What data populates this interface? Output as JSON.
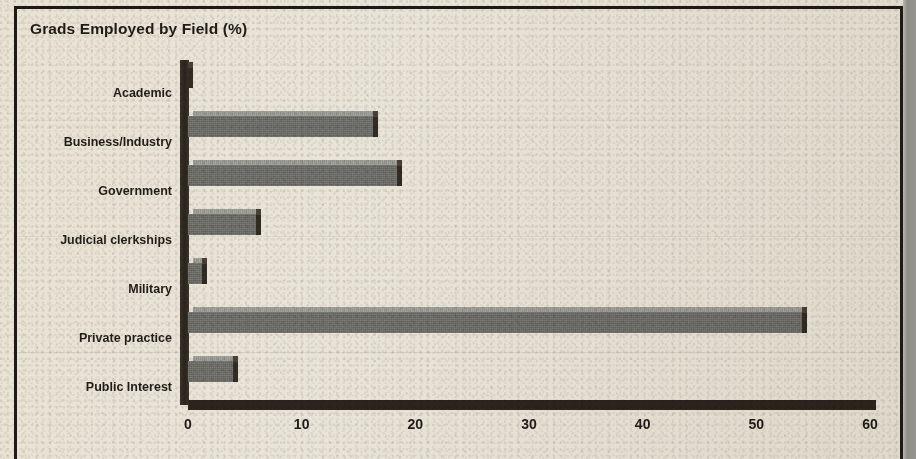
{
  "document": {
    "kind": "scanned-print-figure",
    "background_color": "#e9e4d9",
    "ink_color": "#201d19",
    "gutter_color": "#8f8d86"
  },
  "chart_data": {
    "type": "bar",
    "orientation": "horizontal",
    "title": "Grads Employed by Field (%)",
    "xlabel": "",
    "ylabel": "",
    "xlim": [
      0,
      60
    ],
    "grid": false,
    "legend": null,
    "style": "3d-shaded-bars",
    "bar_top_color": "#9d9d97",
    "bar_face_color": "#6d6d69",
    "bar_side_color": "#332c24",
    "axis_color": "#2b251e",
    "xticks": [
      0,
      10,
      20,
      30,
      40,
      50,
      60
    ],
    "xtick_labels": [
      "0",
      "10",
      "20",
      "30",
      "40",
      "50",
      "60"
    ],
    "categories": [
      "Academic",
      "Business/Industry",
      "Government",
      "Judicial clerkships",
      "Military",
      "Private practice",
      "Public Interest"
    ],
    "values": [
      0,
      16.3,
      18.4,
      6,
      1.2,
      54,
      4
    ],
    "units": "percent"
  }
}
